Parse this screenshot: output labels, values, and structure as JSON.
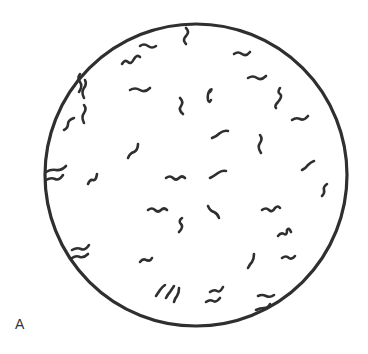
{
  "figure": {
    "panel_label": "A",
    "colors": {
      "background": "#ffffff",
      "ink": "#2f2f2f"
    },
    "field": {
      "cx": 196,
      "cy": 175,
      "r": 151
    },
    "organisms": [
      "M186 28 q4 4 0 8 q-4 4 0 8",
      "M140 46 q4 -3 8 0 q4 3 8 0",
      "M122 64 q3 -5 6 -2 q3 3 6 -3 q3 -5 6 -2",
      "M234 54 q4 -3 8 0 q4 3 8 -2",
      "M248 78 q5 -3 9 0 q4 3 9 -2",
      "M130 90 q5 -3 10 0 q5 3 10 -2",
      "M180 98 q4 4 1 8 q-3 4 2 8",
      "M210 92 q3 -4 0 -2 q-3 4 -2 10 q1 4 3 0",
      "M280 88 q-3 4 0 6 q3 2 -2 8 q-4 4 -2 6",
      "M292 120 q4 -3 8 -1 q4 2 8 -3",
      "M80 74 q-3 4 0 8 q3 4 -1 10",
      "M85 80 q2 4 -1 8 q-3 4 0 10",
      "M64 130 q4 -2 4 -6 q0 -4 6 -6",
      "M84 105 q3 4 0 8 q-3 4 0 10",
      "M212 138 q5 -2 8 -5 q4 -3 8 -2",
      "M260 135 q3 4 0 8 q-3 4 1 10",
      "M128 158 q2 -5 6 -6 q4 -2 4 -8",
      "M88 184 q2 -5 5 -4 q3 1 4 -6",
      "M46 172 q5 -3 10 -2 q5 1 10 -4",
      "M46 180 q5 -3 9 -1 q4 2 8 -4",
      "M210 178 q4 -2 8 -5 q4 -3 8 -2",
      "M302 170 q4 -2 6 -5 q3 -3 6 -4",
      "M166 178 q4 -3 7 0 q3 3 6 0 q3 -3 6 0",
      "M322 196 q3 -3 2 -6 q-1 -3 3 -6",
      "M148 210 q4 -3 7 0 q3 3 6 0 q3 -3 6 0",
      "M182 218 q-4 3 -1 6 q3 3 -2 8",
      "M208 206 q2 5 6 6 q4 2 5 6",
      "M262 210 q4 -3 7 0 q3 3 6 -2 q3 -3 5 0",
      "M278 236 q3 -4 6 -2 q3 2 3 -4 q2 -3 4 2",
      "M282 258 q4 -3 7 0 q3 2 6 -2",
      "M72 250 q5 -3 9 -1 q4 2 8 -4",
      "M72 258 q4 -3 8 -1 q4 1 8 -3",
      "M140 262 q3 -4 6 -2 q4 2 6 -2",
      "M248 268 q2 -4 4 -6 q2 -3 2 -8",
      "M156 296 q2 -3 4 -6 q2 -3 5 -5",
      "M166 298 q2 -4 4 -6 q2 -3 4 -6",
      "M174 302 q1 -4 3 -6 q2 -3 2 -8",
      "M206 302 q4 -3 7 -1 q3 2 7 -3",
      "M210 292 q4 -3 7 -1 q3 2 6 -4",
      "M258 296 q4 -2 8 0 q4 2 8 -1",
      "M256 310 q4 -2 8 -2 q4 0 6 -4"
    ]
  }
}
